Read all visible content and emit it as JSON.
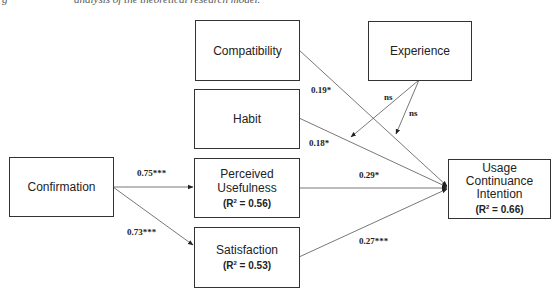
{
  "figure": {
    "caption_lead": "g",
    "caption_rest": "analysis of the theoretical research model."
  },
  "nodes": {
    "compatibility": {
      "label": "Compatibility"
    },
    "experience": {
      "label": "Experience"
    },
    "habit": {
      "label": "Habit"
    },
    "confirmation": {
      "label": "Confirmation"
    },
    "perceived_usefulness": {
      "line1": "Perceived",
      "line2": "Usefulness",
      "r2_label": "(R",
      "r2_sup": "2",
      "r2_value": " = 0.56)"
    },
    "satisfaction": {
      "line1": "Satisfaction",
      "r2_label": "(R",
      "r2_sup": "2",
      "r2_value": " = 0.53)"
    },
    "usage_continuance_intention": {
      "line1": "Usage",
      "line2": "Continuance",
      "line3": "Intention",
      "r2_label": "(R",
      "r2_sup": "2",
      "r2_value": " = 0.66)"
    }
  },
  "paths": {
    "compatibility_to_uci": "0.19*",
    "habit_to_uci": "0.18*",
    "experience_moderates_compatibility": "ns",
    "experience_moderates_habit": "ns",
    "confirmation_to_pu": "0.75***",
    "confirmation_to_satisfaction": "0.73***",
    "pu_to_uci": "0.29*",
    "satisfaction_to_uci": "0.27***"
  },
  "colors": {
    "line": "#444444",
    "box_border": "#333333",
    "background": "#ffffff"
  }
}
